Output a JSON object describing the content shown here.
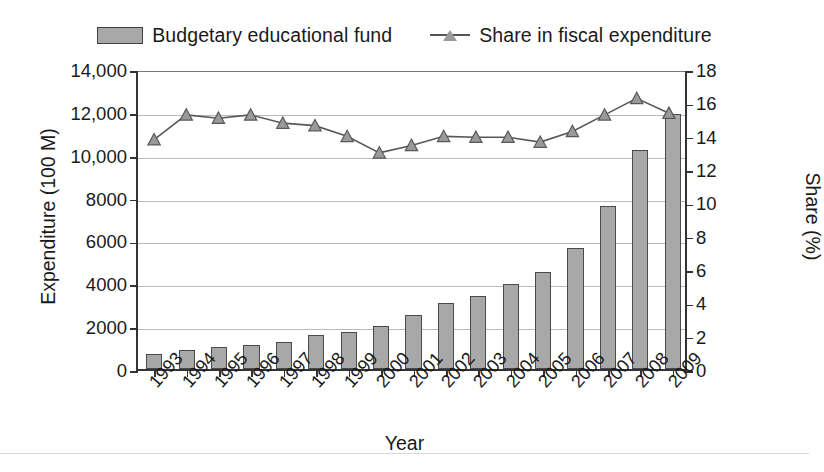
{
  "chart_data": {
    "type": "bar",
    "title": "",
    "xlabel": "Year",
    "ylabel": "Expenditure (100 M)",
    "ylabel_secondary": "Share (%)",
    "grid": true,
    "legend_position": "top-center",
    "categories": [
      "1993",
      "1994",
      "1995",
      "1996",
      "1997",
      "1998",
      "1999",
      "2000",
      "2001",
      "2002",
      "2003",
      "2004",
      "2005",
      "2006",
      "2007",
      "2008",
      "2009"
    ],
    "ylim": [
      0,
      14000
    ],
    "yticks": [
      "0",
      "2000",
      "4000",
      "6000",
      "8000",
      "10,000",
      "12,000",
      "14,000"
    ],
    "ytick_values": [
      0,
      2000,
      4000,
      6000,
      8000,
      10000,
      12000,
      14000
    ],
    "ylim_secondary": [
      0,
      18
    ],
    "yticks_secondary": [
      "0",
      "2",
      "4",
      "6",
      "8",
      "10",
      "12",
      "14",
      "16",
      "18"
    ],
    "ytick_values_secondary": [
      0,
      2,
      4,
      6,
      8,
      10,
      12,
      14,
      16,
      18
    ],
    "series": [
      {
        "name": "Budgetary educational fund",
        "kind": "bar",
        "axis": "left",
        "color": "#a8a8a8",
        "edge_color": "#4a4a4a",
        "values": [
          700,
          880,
          1030,
          1110,
          1280,
          1570,
          1720,
          2020,
          2500,
          3100,
          3400,
          3950,
          4550,
          5650,
          7600,
          10200,
          11900
        ]
      },
      {
        "name": "Share in fiscal expenditure",
        "kind": "line",
        "axis": "right",
        "color": "#585858",
        "marker": "triangle",
        "marker_color": "#9a9a9a",
        "values": [
          13.9,
          15.4,
          15.2,
          15.4,
          14.9,
          14.75,
          14.1,
          13.1,
          13.55,
          14.1,
          14.05,
          14.05,
          13.75,
          14.4,
          15.4,
          16.4,
          15.5
        ]
      }
    ]
  },
  "legend": {
    "items": [
      {
        "label": "Budgetary educational fund",
        "marker": "bar-swatch"
      },
      {
        "label": "Share in fiscal expenditure",
        "marker": "line-triangle"
      }
    ]
  }
}
